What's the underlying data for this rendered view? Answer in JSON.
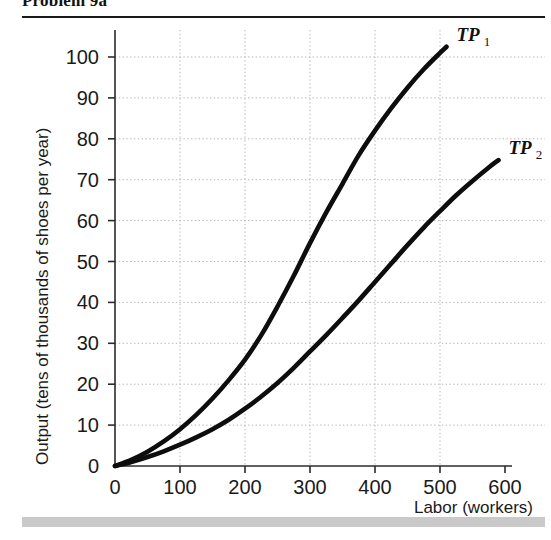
{
  "page": {
    "title": "Problem 9a"
  },
  "chart_data": {
    "type": "line",
    "title": "",
    "xlabel": "Labor (workers)",
    "ylabel": "Output (tens of thousands of shoes per year)",
    "xlim": [
      0,
      600
    ],
    "ylim": [
      0,
      105
    ],
    "grid": true,
    "legend_position": "end-of-line",
    "xticks": [
      0,
      100,
      200,
      300,
      400,
      500,
      600
    ],
    "xtick_labels": [
      "0",
      "100",
      "200",
      "300",
      "400",
      "500",
      "600"
    ],
    "yticks": [
      0,
      10,
      20,
      30,
      40,
      50,
      60,
      70,
      80,
      90,
      100
    ],
    "ytick_labels": [
      "0",
      "10",
      "20",
      "30",
      "40",
      "50",
      "60",
      "70",
      "80",
      "90",
      "100"
    ],
    "gridlines_x": [
      100,
      200,
      300,
      400,
      500
    ],
    "gridlines_y": [
      10,
      20,
      30,
      40,
      50,
      60,
      70,
      80,
      90,
      100
    ],
    "series": [
      {
        "name": "TP 1",
        "label_main": "TP",
        "label_sub": "1",
        "color": "#0d0d0d",
        "x": [
          0,
          25,
          50,
          75,
          100,
          125,
          150,
          175,
          200,
          225,
          250,
          275,
          300,
          325,
          350,
          375,
          400,
          425,
          450,
          475,
          500,
          510
        ],
        "y": [
          0,
          1.5,
          3.5,
          6,
          9,
          12.5,
          16.5,
          21,
          26,
          32,
          39,
          46.5,
          54.5,
          62,
          69,
          76,
          82,
          87.5,
          92.5,
          97,
          101,
          102.5
        ]
      },
      {
        "name": "TP 2",
        "label_main": "TP",
        "label_sub": "2",
        "color": "#0d0d0d",
        "x": [
          0,
          25,
          50,
          75,
          100,
          125,
          150,
          175,
          200,
          225,
          250,
          275,
          300,
          325,
          350,
          375,
          400,
          425,
          450,
          475,
          500,
          525,
          550,
          575,
          590
        ],
        "y": [
          0,
          1,
          2.2,
          3.6,
          5.2,
          7,
          9,
          11.3,
          14,
          17,
          20.3,
          24,
          28,
          32,
          36.2,
          40.5,
          45,
          49.5,
          54,
          58.3,
          62.3,
          66.2,
          69.7,
          73,
          74.8
        ]
      }
    ]
  }
}
